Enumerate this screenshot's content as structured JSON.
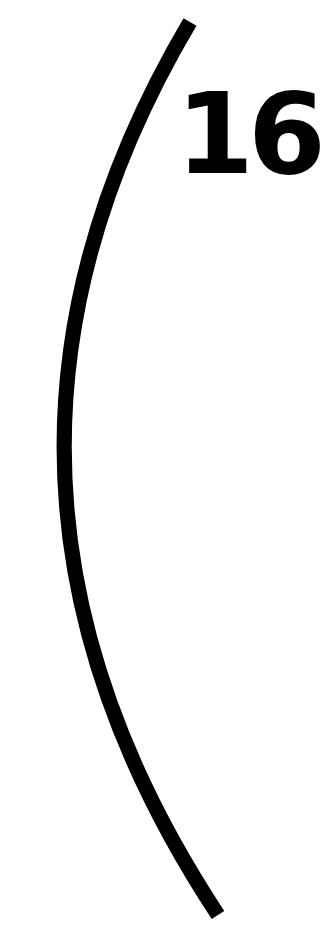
{
  "page": {
    "number": "16",
    "decoration": "left-parenthesis-arc",
    "colors": {
      "background": "#ffffff",
      "ink": "#000000"
    }
  }
}
